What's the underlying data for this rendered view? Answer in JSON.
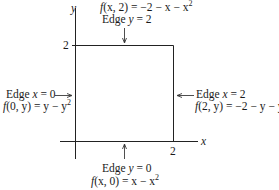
{
  "axes": {
    "x_label": "x",
    "y_label": "y",
    "x_tick": "2",
    "y_tick": "2"
  },
  "region": {
    "shape": "square",
    "x_range": [
      0,
      2
    ],
    "y_range": [
      0,
      2
    ]
  },
  "edges": {
    "top": {
      "title_prefix": "Edge ",
      "title_var": "y",
      "title_eq": " = 2",
      "func_name": "f",
      "func_args": "(x, 2)",
      "func_rhs": " = −2 − x − x",
      "func_exp": "2"
    },
    "left": {
      "title_prefix": "Edge ",
      "title_var": "x",
      "title_eq": " = 0",
      "func_name": "f",
      "func_args": "(0, y)",
      "func_rhs": " = y − y",
      "func_exp": "2"
    },
    "right": {
      "title_prefix": "Edge ",
      "title_var": "x",
      "title_eq": " = 2",
      "func_name": "f",
      "func_args": "(2, y)",
      "func_rhs": " = −2 − y − y",
      "func_exp": "2"
    },
    "bottom": {
      "title_prefix": "Edge ",
      "title_var": "y",
      "title_eq": " = 0",
      "func_name": "f",
      "func_args": "(x, 0)",
      "func_rhs": " = x − x",
      "func_exp": "2"
    }
  }
}
